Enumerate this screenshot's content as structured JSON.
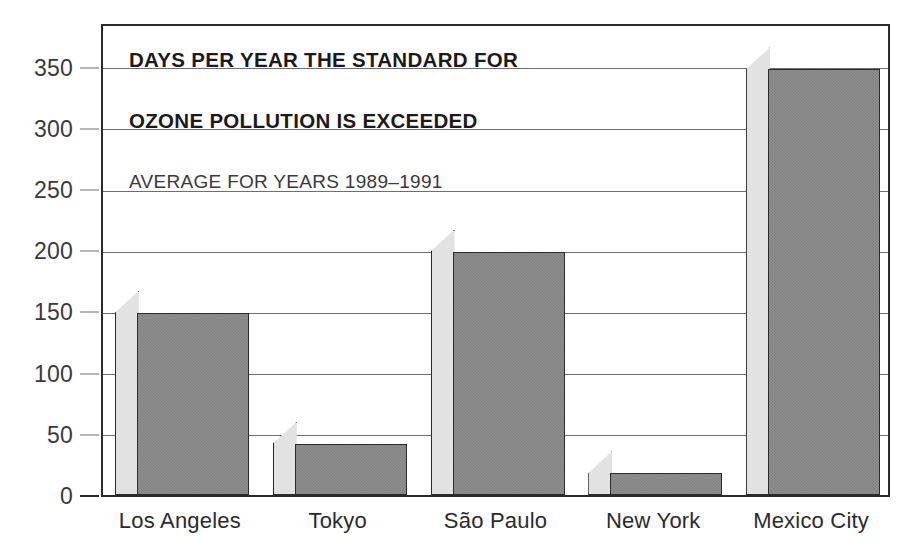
{
  "chart_data": {
    "type": "bar",
    "title": "DAYS PER YEAR THE STANDARD FOR OZONE POLLUTION IS EXCEEDED",
    "title_lines": [
      "DAYS PER YEAR THE STANDARD FOR",
      "OZONE POLLUTION IS EXCEEDED"
    ],
    "subtitle": "AVERAGE FOR YEARS 1989–1991",
    "categories": [
      "Los Angeles",
      "Tokyo",
      "São Paulo",
      "New York",
      "Mexico City"
    ],
    "values": [
      149,
      42,
      199,
      18,
      348
    ],
    "xlabel": "",
    "ylabel": "",
    "ylim": [
      0,
      385
    ],
    "yticks": [
      0,
      50,
      100,
      150,
      200,
      250,
      300,
      350
    ],
    "ytick_labels": [
      "0",
      "50",
      "100",
      "150",
      "200",
      "250",
      "300",
      "350"
    ],
    "grid": true,
    "legend": false,
    "bar_style": "3d-extruded",
    "colors": {
      "bar_front": "#808080",
      "bar_side": "#e2e2e2",
      "outline": "#2b2b2b",
      "gridline": "#6e6e6e",
      "background": "#ffffff",
      "title_text": "#1a1a1a",
      "subtitle_text": "#3a3a3a",
      "tick_text": "#3a3a3a"
    }
  }
}
